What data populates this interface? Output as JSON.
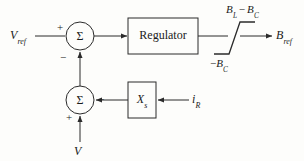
{
  "diagram": {
    "stroke_color": "#2b2b2b",
    "background_color": "#fdfdfb",
    "text_color": "#1a1a1a",
    "inputs": {
      "reference_voltage": {
        "symbol": "V",
        "subscript": "ref"
      },
      "measured_voltage": {
        "symbol": "V",
        "subscript": ""
      },
      "reactive_current": {
        "symbol": "i",
        "subscript": "R"
      }
    },
    "outputs": {
      "reference_susceptance": {
        "symbol": "B",
        "subscript": "ref"
      }
    },
    "blocks": [
      {
        "id": "regulator",
        "label": "Regulator",
        "shape": "rectangle"
      },
      {
        "id": "slope-reactance",
        "symbol": "X",
        "subscript": "s",
        "shape": "rectangle"
      },
      {
        "id": "limiter",
        "label": "",
        "shape": "saturation"
      }
    ],
    "summing_junctions": [
      {
        "id": "top-summer",
        "glyph": "Σ",
        "inputs": [
          {
            "port": "left",
            "sign": "+"
          },
          {
            "port": "bottom",
            "sign": "−"
          }
        ]
      },
      {
        "id": "bottom-summer",
        "glyph": "Σ",
        "inputs": [
          {
            "port": "right",
            "sign": "−"
          },
          {
            "port": "bottom",
            "sign": "+"
          }
        ]
      }
    ],
    "limiter_labels": {
      "upper": {
        "minuend": "B",
        "minuend_sub": "L",
        "operator": "−",
        "subtrahend": "B",
        "subtrahend_sub": "C"
      },
      "lower": {
        "operator": "−",
        "symbol": "B",
        "symbol_sub": "C"
      }
    }
  }
}
